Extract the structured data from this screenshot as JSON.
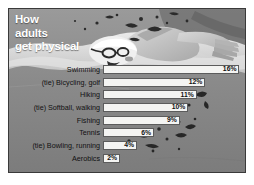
{
  "figure": {
    "title_lines": [
      "How",
      "adults",
      "get physical"
    ],
    "background_art": "swimmer-illustration",
    "frame_color": "#3a3a3a",
    "background_color": "#888888",
    "bar_fill_color": "#f4f4f2",
    "bar_border_color": "#5c5c5c",
    "title_color": "#ffffff",
    "label_color": "#111111"
  },
  "chart_data": {
    "type": "bar",
    "orientation": "horizontal",
    "title": "How adults get physical",
    "xlabel": "",
    "ylabel": "",
    "xlim": [
      0,
      17
    ],
    "grid": false,
    "legend": "none",
    "value_suffix": "%",
    "categories": [
      "Swimming",
      "(tie) Bicycling, golf",
      "Hiking",
      "(tie) Softball, walking",
      "Fishing",
      "Tennis",
      "(tie) Bowling, running",
      "Aerobics"
    ],
    "values": [
      16,
      12,
      11,
      10,
      9,
      6,
      4,
      2
    ],
    "value_labels": [
      "16%",
      "12%",
      "11%",
      "10%",
      "9%",
      "6%",
      "4%",
      "2%"
    ]
  }
}
